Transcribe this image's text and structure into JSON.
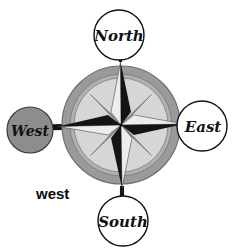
{
  "figure": {
    "kind": "compass-rose-diagram",
    "background_color": "#ffffff",
    "width": 233,
    "height": 251
  },
  "rose": {
    "center_x": 121,
    "center_y": 125,
    "outer_radius": 59,
    "outer_ring_color": "#9a9a9a",
    "outer_ring_edge_color": "#6f6f6f",
    "inner_disc_color": "#d6d6d6",
    "inner_ring_color": "#b3b3b3",
    "star_dark_color": "#111111",
    "star_light_color": "#e6e6e6",
    "star_mid_color": "#c2c2c2",
    "point_count": 8
  },
  "labels": {
    "north": {
      "text": "North",
      "cx": 119,
      "cy": 35,
      "r": 25,
      "fill": "#ffffff",
      "stroke": "#111111",
      "font_size": 15
    },
    "east": {
      "text": "East",
      "cx": 202,
      "cy": 126,
      "r": 25,
      "fill": "#ffffff",
      "stroke": "#111111",
      "font_size": 15
    },
    "south": {
      "text": "South",
      "cx": 123,
      "cy": 221,
      "r": 25,
      "fill": "#ffffff",
      "stroke": "#111111",
      "font_size": 15
    },
    "west": {
      "text": "West",
      "cx": 30,
      "cy": 130,
      "r": 23,
      "fill": "#8d8d8d",
      "stroke": "#3a3a3a",
      "font_size": 14,
      "highlighted": true
    }
  },
  "caption": {
    "text": "west",
    "x": 36,
    "y": 199,
    "font_size": 15
  }
}
